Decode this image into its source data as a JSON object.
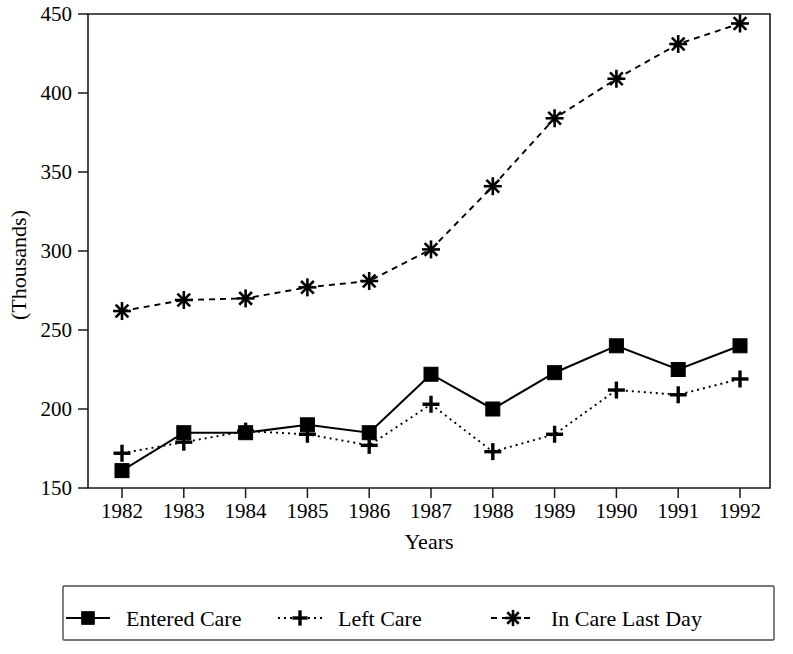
{
  "chart_data": {
    "type": "line",
    "title": "",
    "xlabel": "Years",
    "ylabel": "(Thousands)",
    "categories": [
      "1982",
      "1983",
      "1984",
      "1985",
      "1986",
      "1987",
      "1988",
      "1989",
      "1990",
      "1991",
      "1992"
    ],
    "xlim": [
      1982,
      1992
    ],
    "ylim": [
      150,
      450
    ],
    "yticks": [
      "150",
      "200",
      "250",
      "300",
      "350",
      "400",
      "450"
    ],
    "grid": false,
    "legend_position": "bottom",
    "series": [
      {
        "name": "Entered Care",
        "marker": "filled-square",
        "linestyle": "solid",
        "values": [
          161,
          185,
          185,
          190,
          185,
          222,
          200,
          223,
          240,
          225,
          240
        ]
      },
      {
        "name": "Left Care",
        "marker": "plus",
        "linestyle": "dotted",
        "values": [
          172,
          179,
          186,
          184,
          177,
          203,
          173,
          184,
          212,
          209,
          219
        ]
      },
      {
        "name": "In Care Last Day",
        "marker": "asterisk",
        "linestyle": "dashed",
        "values": [
          262,
          269,
          270,
          277,
          281,
          301,
          341,
          384,
          409,
          431,
          444
        ]
      }
    ]
  },
  "axes": {
    "y_axis_title": "(Thousands)",
    "x_axis_title": "Years"
  },
  "legend": {
    "items": [
      {
        "label": "Entered Care",
        "marker": "filled-square",
        "linestyle": "solid"
      },
      {
        "label": "Left Care",
        "marker": "plus",
        "linestyle": "dotted"
      },
      {
        "label": "In Care Last Day",
        "marker": "asterisk",
        "linestyle": "dashed"
      }
    ]
  },
  "colors": {
    "ink": "#000000",
    "frame": "#1a1a1a",
    "background": "#ffffff"
  }
}
